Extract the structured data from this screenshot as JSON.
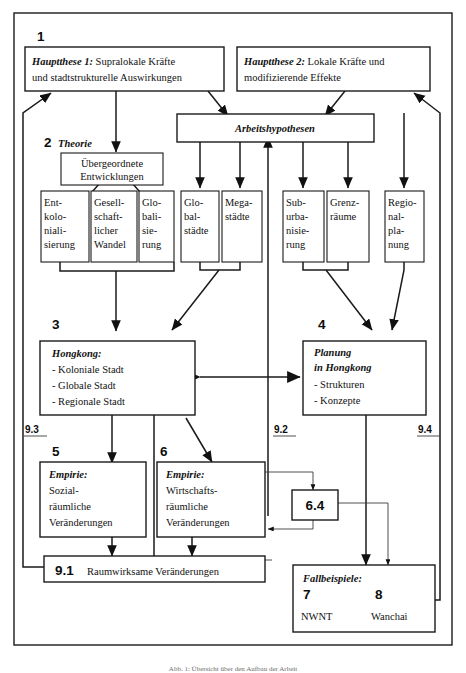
{
  "diagram": {
    "title_caption": "Abb. 1: Übersicht über den Aufbau der Arbeit",
    "section_numbers": {
      "n1": "1",
      "n2": "2",
      "n3": "3",
      "n4": "4",
      "n5": "5",
      "n6": "6",
      "n7": "7",
      "n8": "8",
      "n64": "6.4",
      "n91": "9.1",
      "n92": "9.2",
      "n93": "9.3",
      "n94": "9.4"
    },
    "theory_label": "Theorie",
    "boxes": {
      "hauptthese1": {
        "lead": "Hauptthese 1:",
        "rest": " Supralokale Kräfte",
        "line2": "und stadtstrukturelle Auswirkungen"
      },
      "hauptthese2": {
        "lead": "Hauptthese 2:",
        "rest": " Lokale Kräfte und",
        "line2": "modifizierende Effekte"
      },
      "arbeitshypothesen": {
        "label": "Arbeitshypothesen"
      },
      "uebergeordnete": {
        "line1": "Übergeordnete",
        "line2": "Entwicklungen"
      },
      "entkolonialisierung": [
        "Ent-",
        "kolo-",
        "niali-",
        "sierung"
      ],
      "gesellschaftlicher_wandel": [
        "Gesell-",
        "schaft-",
        "licher",
        "Wandel"
      ],
      "globalisierung": [
        "Glo-",
        "bali-",
        "sie-",
        "rung"
      ],
      "globalstaedte": [
        "Glo-",
        "bal-",
        "städte"
      ],
      "megastaedte": [
        "Mega-",
        "städte"
      ],
      "suburbanisierung": [
        "Sub-",
        "urba-",
        "nisie-",
        "rung"
      ],
      "grenzraeume": [
        "Grenz-",
        "räume"
      ],
      "regionalplanung": [
        "Regio-",
        "nal-",
        "pla-",
        "nung"
      ],
      "hongkong": {
        "title": "Hongkong:",
        "items": [
          "- Koloniale Stadt",
          "- Globale Stadt",
          "- Regionale Stadt"
        ]
      },
      "planung": {
        "title1": "Planung",
        "title2": "in Hongkong",
        "items": [
          "- Strukturen",
          "- Konzepte"
        ]
      },
      "empirie_sozial": {
        "title": "Empirie:",
        "lines": [
          "Sozial-",
          "räumliche",
          "Veränderungen"
        ]
      },
      "empirie_wirtschaft": {
        "title": "Empirie:",
        "lines": [
          "Wirtschafts-",
          "räumliche",
          "Veränderungen"
        ]
      },
      "raumwirksame": {
        "num": "9.1",
        "label": "Raumwirksame Veränderungen"
      },
      "fallbeispiele": {
        "title": "Fallbeispiele:",
        "n7": "7",
        "n8": "8",
        "case1": "NWNT",
        "case2": "Wanchai"
      }
    },
    "colors": {
      "stroke": "#1a1a1a",
      "background": "#ffffff",
      "text": "#111111"
    }
  }
}
